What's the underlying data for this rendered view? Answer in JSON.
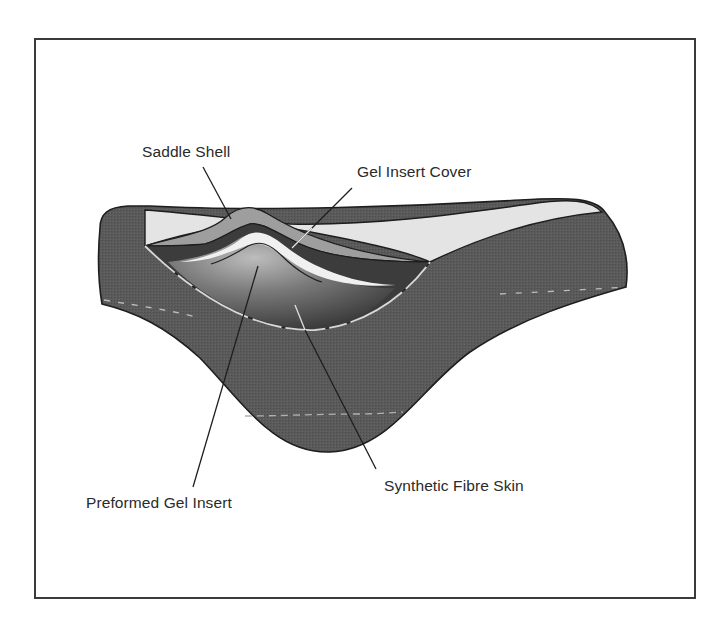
{
  "figure": {
    "labels": {
      "saddle_shell": "Saddle Shell",
      "gel_insert_cover": "Gel Insert Cover",
      "preformed_gel_insert": "Preformed Gel Insert",
      "synthetic_fibre_skin": "Synthetic Fibre Skin"
    },
    "colors": {
      "body": "#5a5a5a",
      "top_surface": "#e4e4e4",
      "shell": "#9e9e9e",
      "cover": "#3c3c3c",
      "gel_light": "#f0f0f0",
      "gel_shade": "#777777",
      "outline": "#1e1e1e",
      "frame": "#3a3a3a"
    }
  }
}
